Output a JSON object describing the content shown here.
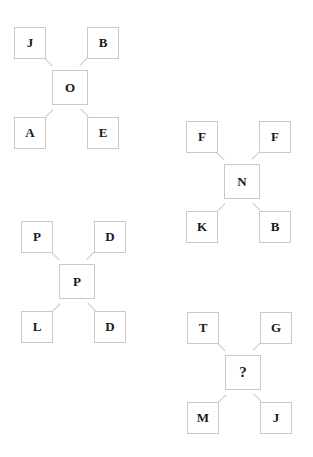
{
  "diagram": {
    "type": "letter-cross-puzzle",
    "border_color": "#c9c9c9",
    "text_color": "#1a1a1a",
    "background_color": "#ffffff",
    "puzzles": [
      {
        "name": "puzzle-1",
        "top_left": "J",
        "top_right": "B",
        "center": "O",
        "bottom_left": "A",
        "bottom_right": "E",
        "is_unknown": false
      },
      {
        "name": "puzzle-2",
        "top_left": "F",
        "top_right": "F",
        "center": "N",
        "bottom_left": "K",
        "bottom_right": "B",
        "is_unknown": false
      },
      {
        "name": "puzzle-3",
        "top_left": "P",
        "top_right": "D",
        "center": "P",
        "bottom_left": "L",
        "bottom_right": "D",
        "is_unknown": false
      },
      {
        "name": "puzzle-4",
        "top_left": "T",
        "top_right": "G",
        "center": "?",
        "bottom_left": "M",
        "bottom_right": "J",
        "is_unknown": true
      }
    ]
  }
}
